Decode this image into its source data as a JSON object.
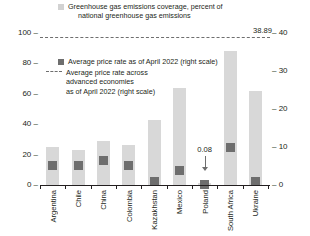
{
  "chart_data": {
    "type": "bar",
    "title": "",
    "categories": [
      "Argentina",
      "Chile",
      "China",
      "Colombia",
      "Kazakhstan",
      "Mexico",
      "Poland",
      "South Africa",
      "Ukraine"
    ],
    "series": [
      {
        "name": "Greenhouse gas emissions coverage, percent of national greenhouse gas emissions",
        "axis": "left",
        "type": "bar",
        "color": "#d8d8d8",
        "values": [
          25,
          23,
          29,
          26,
          43,
          64,
          1,
          88,
          62
        ]
      },
      {
        "name": "Average price rate as of April 2022 (right scale)",
        "axis": "right",
        "type": "marker",
        "color": "#6e6e6e",
        "values": [
          5.2,
          5.2,
          6.5,
          5.2,
          1.0,
          3.8,
          0.08,
          10.0,
          0.9
        ]
      }
    ],
    "reference_line": {
      "name": "Average price rate across advanced economies as of April 2022 (right scale)",
      "axis": "right",
      "value": 38.89,
      "label": "38.89",
      "style": "dashed",
      "color": "#6e6e6e"
    },
    "annotations": [
      {
        "text": "0.08",
        "category": "Poland",
        "series": "Average price rate as of April 2022 (right scale)",
        "arrow": "down"
      }
    ],
    "xlabel": "",
    "ylabel": "",
    "ylabel_right": "",
    "ylim": [
      0,
      100
    ],
    "ylim_right": [
      0,
      40
    ],
    "yticks": [
      "0",
      "20",
      "40",
      "60",
      "80",
      "100"
    ],
    "yticks_right": [
      "0",
      "10",
      "20",
      "30",
      "40"
    ],
    "grid": false,
    "legend_position": "top-left"
  },
  "legend": {
    "coverage_line1": "Greenhouse gas emissions coverage, percent of",
    "coverage_line2": "national greenhouse gas emissions",
    "price_label": "Average price rate as of April 2022 (right scale)",
    "avg_line1": "Average price rate across",
    "avg_line2": "advanced economies",
    "avg_line3": "as of April 2022 (right scale)"
  },
  "axis": {
    "left_ticks": [
      "100",
      "80",
      "60",
      "40",
      "20",
      "0"
    ],
    "right_ticks": [
      "40",
      "30",
      "20",
      "10",
      "0"
    ],
    "tick_dash": "–"
  },
  "annotation": {
    "poland_value": "0.08"
  },
  "reference": {
    "value_label": "38.89"
  },
  "colors": {
    "bar": "#d8d8d8",
    "marker": "#6e6e6e",
    "line": "#6e6e6e",
    "axis": "#231f20",
    "text": "#231f20"
  }
}
